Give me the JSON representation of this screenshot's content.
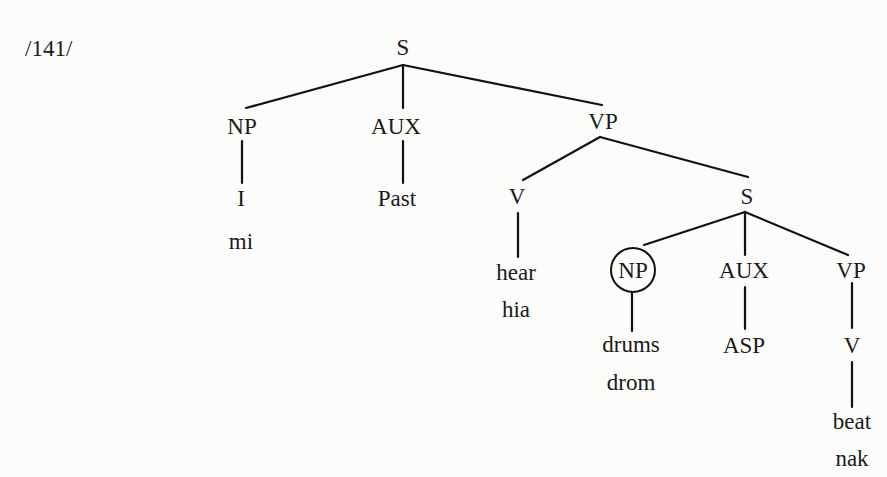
{
  "example_number": "/141/",
  "tree": {
    "root": "S",
    "nodes": {
      "s_root": "S",
      "np1": "NP",
      "aux1": "AUX",
      "vp1": "VP",
      "np1_word": "I",
      "np1_gloss": "mi",
      "aux1_word": "Past",
      "v1": "V",
      "s_embedded": "S",
      "v1_word": "hear",
      "v1_gloss": "hia",
      "np2": "NP",
      "aux2": "AUX",
      "vp2": "VP",
      "np2_word": "drums",
      "np2_gloss": "drom",
      "aux2_word": "ASP",
      "v2": "V",
      "v2_word": "beat",
      "v2_gloss": "nak"
    },
    "highlighted_node": "np2",
    "highlight_style": "circle"
  }
}
